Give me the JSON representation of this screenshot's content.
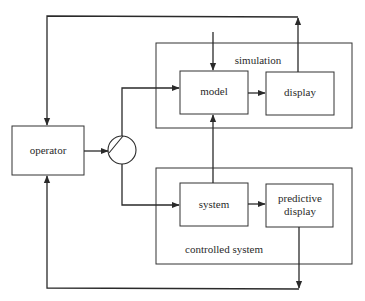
{
  "diagram": {
    "type": "block-diagram",
    "colors": {
      "stroke": "#2a2a2a",
      "background": "#ffffff"
    },
    "groups": {
      "simulation": {
        "label": "simulation"
      },
      "controlled_system": {
        "label": "controlled system"
      }
    },
    "blocks": {
      "operator": {
        "label": "operator"
      },
      "model": {
        "label": "model"
      },
      "display": {
        "label": "display"
      },
      "system": {
        "label": "system"
      },
      "predictive_display": {
        "label_line1": "predictive",
        "label_line2": "display"
      }
    },
    "switch": {
      "name": "switch-junction"
    },
    "edges": [
      {
        "from": "operator",
        "to": "switch"
      },
      {
        "from": "switch",
        "to": "model"
      },
      {
        "from": "switch",
        "to": "system"
      },
      {
        "from": "model",
        "to": "display"
      },
      {
        "from": "system",
        "to": "predictive_display"
      },
      {
        "from": "system",
        "to": "model"
      },
      {
        "from": "display",
        "to": "operator"
      },
      {
        "from": "predictive_display",
        "to": "operator"
      },
      {
        "from": "external",
        "to": "model"
      }
    ]
  }
}
